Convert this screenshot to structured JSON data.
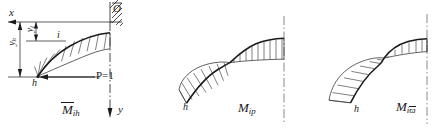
{
  "figure": {
    "ink_color": "#1a1a1a",
    "hatch_color": "#3a3a3a",
    "background": "#ffffff"
  },
  "diagram1": {
    "name": "M-bar-ih diagram",
    "caption_base": "M",
    "caption_sub": "ih",
    "caption_overbar": true,
    "axis_x_label": "x",
    "axis_y_label": "y",
    "origin_label": "O",
    "node_label": "h",
    "section_label": "i",
    "dim_yi_base": "y",
    "dim_yi_sub": "i",
    "dim_yh_base": "y",
    "dim_yh_sub": "h",
    "load_label": "P=1",
    "support": "fixed-wall-hatching"
  },
  "diagram2": {
    "name": "M-ip diagram",
    "caption_base": "M",
    "caption_sub": "ip",
    "caption_overbar": false,
    "node_label": "h"
  },
  "diagram3": {
    "name": "M-i-omega-bar diagram",
    "caption_base": "M",
    "caption_sub": "i",
    "caption_sub2": "ϖ",
    "caption_sub2_overbar": true,
    "caption_overbar": false,
    "node_label": "h"
  }
}
